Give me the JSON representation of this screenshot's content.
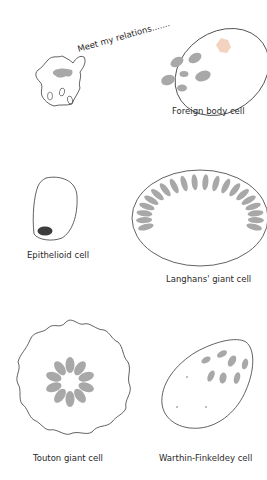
{
  "figure": {
    "speech_bubble": "Meet my relations.......",
    "cells": [
      {
        "id": "macrophage",
        "label": ""
      },
      {
        "id": "foreign-body",
        "label": "Foreign body cell"
      },
      {
        "id": "epithelioid",
        "label": "Epithelioid cell"
      },
      {
        "id": "langhans",
        "label": "Langhans' giant cell"
      },
      {
        "id": "touton",
        "label": "Touton giant cell"
      },
      {
        "id": "warthin-finkeldey",
        "label": "Warthin-Finkeldey cell"
      }
    ],
    "colors": {
      "outline": "#3a3a3a",
      "nucleus": "#a8a8a8",
      "dark_nucleus": "#3c3c3c",
      "crystal": "#f0c8b0"
    }
  }
}
